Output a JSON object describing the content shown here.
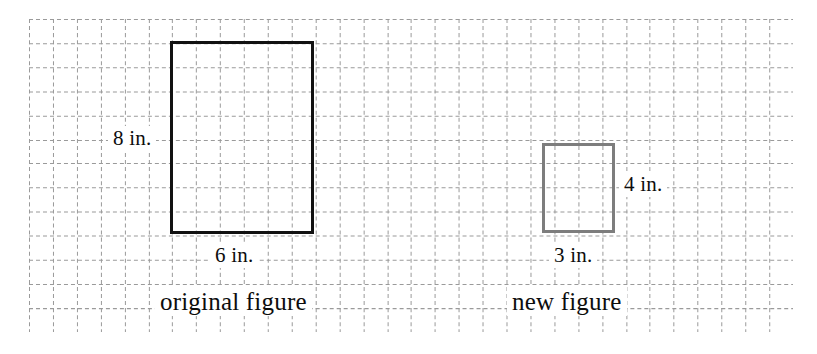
{
  "canvas": {
    "width": 817,
    "height": 354,
    "background": "#ffffff"
  },
  "grid": {
    "kind": "dashed-graph-paper",
    "origin_x": 29,
    "origin_y": 19,
    "spacing": 23.9,
    "columns": 32,
    "rows": 13,
    "line_color": "#9a9a9a",
    "dash": "4 3",
    "line_width": 1
  },
  "figures": [
    {
      "id": "original",
      "shape": "rectangle",
      "name_label": "original figure",
      "width_label": "6 in.",
      "height_label": "8 in.",
      "width_units": 6,
      "height_units": 8,
      "width_inches": 6,
      "height_inches": 8,
      "stroke_color": "#111111",
      "stroke_width": 3,
      "fill": "none",
      "x": 170,
      "y": 41,
      "px_width": 144,
      "px_height": 193
    },
    {
      "id": "new",
      "shape": "rectangle",
      "name_label": "new figure",
      "width_label": "3 in.",
      "height_label": "4 in.",
      "width_units": 3,
      "height_units": 4,
      "width_inches": 3,
      "height_inches": 4,
      "stroke_color": "#7d7d7d",
      "stroke_width": 3,
      "fill": "none",
      "x": 542,
      "y": 143,
      "px_width": 73,
      "px_height": 90
    }
  ],
  "labels": {
    "original_height": "8 in.",
    "original_width": "6 in.",
    "original_name": "original figure",
    "new_height": "4 in.",
    "new_width": "3 in.",
    "new_name": "new figure"
  },
  "colors": {
    "grid_line": "#9a9a9a",
    "original_stroke": "#111111",
    "new_stroke": "#7d7d7d",
    "text": "#0d0d0d",
    "background": "#ffffff"
  }
}
